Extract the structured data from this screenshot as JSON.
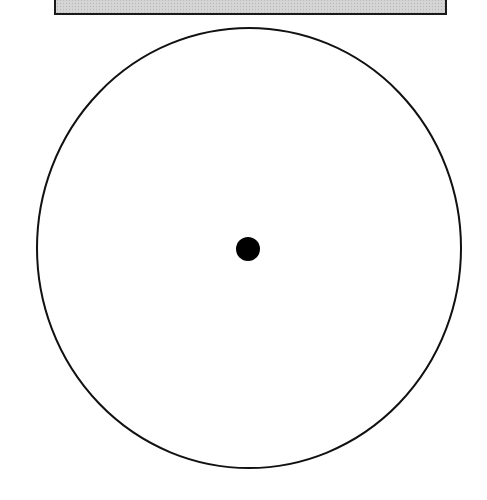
{
  "diagram": {
    "top_bar": {
      "fill": "#d4d4d4",
      "stroke": "#1a1a1a",
      "pattern": "stipple"
    },
    "circle": {
      "cx": 249,
      "cy": 248,
      "rx": 212,
      "ry": 220,
      "stroke": "#111111",
      "stroke_width": 2,
      "fill": "#ffffff"
    },
    "center_dot": {
      "cx": 248,
      "cy": 249,
      "r": 12,
      "fill": "#000000"
    }
  }
}
